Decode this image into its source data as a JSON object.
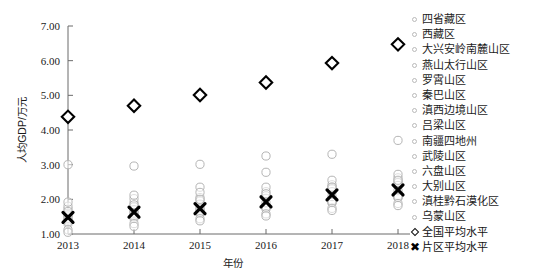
{
  "chart_data": {
    "type": "scatter",
    "title": "",
    "xlabel": "年份",
    "ylabel": "人均GDP/万元",
    "x": [
      2013,
      2014,
      2015,
      2016,
      2017,
      2018
    ],
    "xticklabels": [
      "2013",
      "2014",
      "2015",
      "2016",
      "2017",
      "2018"
    ],
    "yticklabels": [
      "1.00",
      "2.00",
      "3.00",
      "4.00",
      "5.00",
      "6.00",
      "7.00"
    ],
    "yticks": [
      1.0,
      2.0,
      3.0,
      4.0,
      5.0,
      6.0,
      7.0
    ],
    "ylim": [
      1.0,
      7.0
    ],
    "grid": false,
    "legend_position": "right",
    "series": [
      {
        "name": "四省藏区",
        "marker": "circle",
        "values": [
          1.72,
          1.9,
          2.05,
          2.22,
          2.42,
          2.62
        ]
      },
      {
        "name": "西藏区",
        "marker": "circle",
        "values": [
          3.0,
          2.96,
          3.01,
          3.25,
          3.3,
          3.7
        ]
      },
      {
        "name": "大兴安岭南麓山区",
        "marker": "circle",
        "values": [
          1.8,
          2.02,
          2.35,
          2.78,
          2.36,
          2.52
        ]
      },
      {
        "name": "燕山太行山区",
        "marker": "circle",
        "values": [
          1.92,
          2.12,
          2.2,
          2.35,
          2.55,
          2.72
        ]
      },
      {
        "name": "罗霄山区",
        "marker": "circle",
        "values": [
          1.6,
          1.78,
          1.95,
          2.1,
          2.3,
          2.48
        ]
      },
      {
        "name": "秦巴山区",
        "marker": "circle",
        "values": [
          1.5,
          1.7,
          1.86,
          2.03,
          2.22,
          2.4
        ]
      },
      {
        "name": "滇西边境山区",
        "marker": "circle",
        "values": [
          1.3,
          1.45,
          1.6,
          1.73,
          1.9,
          2.05
        ]
      },
      {
        "name": "吕梁山区",
        "marker": "circle",
        "values": [
          1.55,
          1.62,
          1.7,
          1.8,
          1.98,
          2.12
        ]
      },
      {
        "name": "南疆四地州",
        "marker": "circle",
        "values": [
          1.4,
          1.55,
          1.66,
          1.78,
          1.94,
          2.08
        ]
      },
      {
        "name": "武陵山区",
        "marker": "circle",
        "values": [
          1.45,
          1.6,
          1.75,
          1.9,
          2.08,
          2.25
        ]
      },
      {
        "name": "六盘山区",
        "marker": "circle",
        "values": [
          1.35,
          1.5,
          1.62,
          1.76,
          1.92,
          2.06
        ]
      },
      {
        "name": "大别山区",
        "marker": "circle",
        "values": [
          1.65,
          1.84,
          2.0,
          2.16,
          2.35,
          2.55
        ]
      },
      {
        "name": "滇桂黔石漠化区",
        "marker": "circle",
        "values": [
          1.12,
          1.3,
          1.44,
          1.58,
          1.74,
          1.88
        ]
      },
      {
        "name": "乌蒙山区",
        "marker": "circle",
        "values": [
          1.05,
          1.22,
          1.38,
          1.52,
          1.68,
          1.82
        ]
      },
      {
        "name": "全国平均水平",
        "marker": "diamond",
        "values": [
          4.38,
          4.7,
          5.01,
          5.37,
          5.93,
          6.47
        ]
      },
      {
        "name": "片区平均水平",
        "marker": "x",
        "values": [
          1.48,
          1.63,
          1.73,
          1.93,
          2.13,
          2.27
        ]
      }
    ]
  },
  "axes": {
    "y_title": "人均GDP/万元",
    "x_title": "年份"
  },
  "legend": {
    "items": [
      {
        "label": "四省藏区",
        "marker": "circle"
      },
      {
        "label": "西藏区",
        "marker": "circle"
      },
      {
        "label": "大兴安岭南麓山区",
        "marker": "circle"
      },
      {
        "label": "燕山太行山区",
        "marker": "circle"
      },
      {
        "label": "罗霄山区",
        "marker": "circle"
      },
      {
        "label": "秦巴山区",
        "marker": "circle"
      },
      {
        "label": "滇西边境山区",
        "marker": "circle"
      },
      {
        "label": "吕梁山区",
        "marker": "circle"
      },
      {
        "label": "南疆四地州",
        "marker": "circle"
      },
      {
        "label": "武陵山区",
        "marker": "circle"
      },
      {
        "label": "六盘山区",
        "marker": "circle"
      },
      {
        "label": "大别山区",
        "marker": "circle"
      },
      {
        "label": "滇桂黔石漠化区",
        "marker": "circle"
      },
      {
        "label": "乌蒙山区",
        "marker": "circle"
      },
      {
        "label": "全国平均水平",
        "marker": "diamond"
      },
      {
        "label": "片区平均水平",
        "marker": "x"
      }
    ]
  },
  "colors": {
    "axis": "#6b6b6b",
    "marker_outline": "#b5b5b5",
    "highlight": "#000000",
    "background": "#ffffff"
  }
}
